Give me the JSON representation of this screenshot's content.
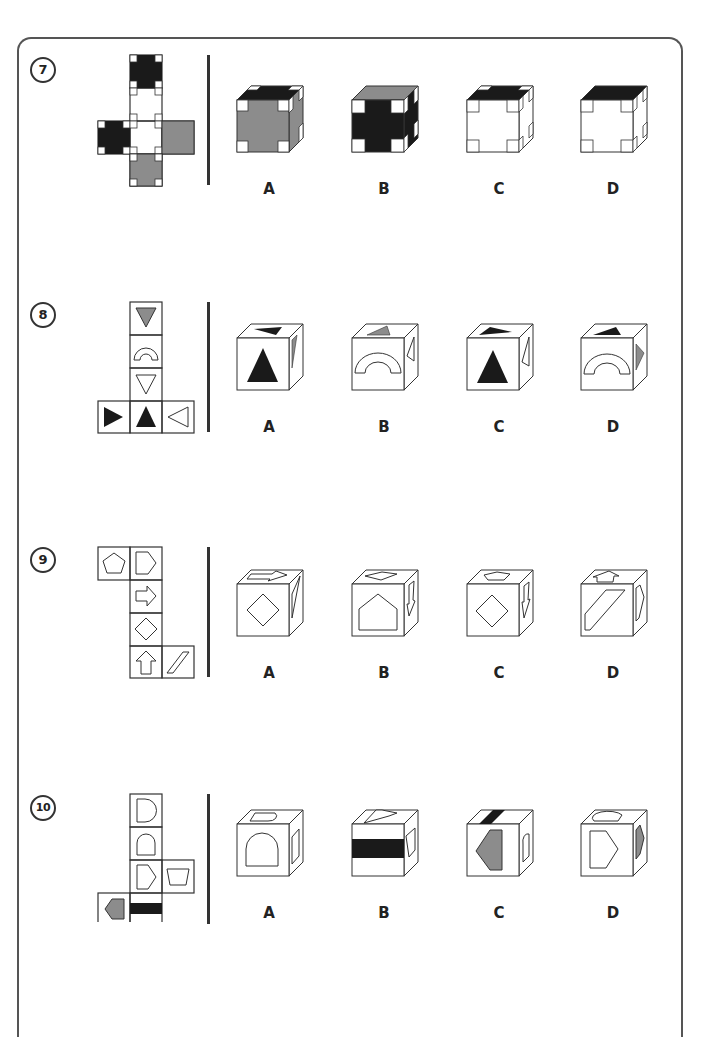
{
  "worksheet": {
    "problems": [
      {
        "number": "7",
        "description": "Net of a cube with cross-shaped patterns (black, white, grey faces); choose the cube that can be folded from it",
        "options": [
          {
            "label": "A"
          },
          {
            "label": "B"
          },
          {
            "label": "C"
          },
          {
            "label": "D"
          }
        ]
      },
      {
        "number": "8",
        "description": "Net of a cube with triangles and an arch; choose the cube that can be folded from it",
        "options": [
          {
            "label": "A"
          },
          {
            "label": "B"
          },
          {
            "label": "C"
          },
          {
            "label": "D"
          }
        ]
      },
      {
        "number": "9",
        "description": "Net of a cube with pentagon, house-shape, arrows, diamond and parallelogram; choose the cube that can be folded from it",
        "options": [
          {
            "label": "A"
          },
          {
            "label": "B"
          },
          {
            "label": "C"
          },
          {
            "label": "D"
          }
        ]
      },
      {
        "number": "10",
        "description": "Net of a cube with D-shapes, arch, pentagon, trapezium, grey arrow-pentagon and black band; choose the cube that can be folded from it",
        "options": [
          {
            "label": "A"
          },
          {
            "label": "B"
          },
          {
            "label": "C"
          },
          {
            "label": "D"
          }
        ]
      }
    ]
  },
  "colors": {
    "black": "#1a1a1a",
    "grey": "#8c8c8c",
    "outline": "#333333",
    "background": "#ffffff"
  }
}
